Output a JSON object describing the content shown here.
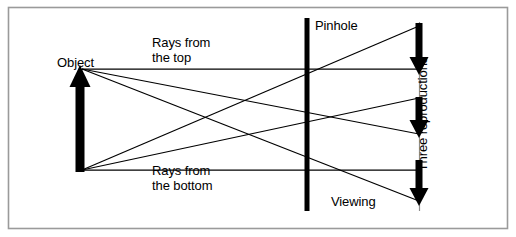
{
  "figure": {
    "type": "optics-ray-diagram",
    "width": 516,
    "height": 237,
    "background_color": "#ffffff",
    "border_color": "#9a9a9a",
    "stroke_color": "#000000"
  },
  "labels": {
    "object": "Object",
    "rays_from_the_top": "Rays from\nthe top",
    "rays_from_the_bottom": "Rays from\nthe bottom",
    "pinhole": "Pinhole",
    "viewing": "Viewing",
    "three_reproductions": "Three reproductions"
  },
  "diagram_data": {
    "object_arrow": {
      "name": "object-arrow",
      "direction": "up",
      "x": 80,
      "tip_y": 66,
      "base_y": 172,
      "shaft_width": 9,
      "head_width": 21,
      "head_height": 22
    },
    "pinhole_barrier": {
      "name": "pinhole-barrier",
      "x": 307,
      "top_y": 18,
      "bottom_y": 211,
      "width": 5
    },
    "viewing_screen": {
      "name": "viewing-screen",
      "x": 419,
      "top_y": 22,
      "bottom_y": 211
    },
    "reproduction_arrows": [
      {
        "name": "reproduction-arrow-1",
        "x": 419,
        "from_y": 23,
        "to_y": 73
      },
      {
        "name": "reproduction-arrow-2",
        "x": 419,
        "from_y": 97,
        "to_y": 136
      },
      {
        "name": "reproduction-arrow-3",
        "x": 419,
        "from_y": 160,
        "to_y": 204
      }
    ],
    "top_rays": [
      {
        "from": [
          82,
          69
        ],
        "to": [
          419,
          69
        ],
        "note": "top ray to middle-screen level"
      },
      {
        "from": [
          82,
          69
        ],
        "to": [
          419,
          134
        ],
        "note": "top ray crossing pinhole downward"
      },
      {
        "from": [
          82,
          69
        ],
        "to": [
          419,
          201
        ],
        "note": "top ray to bottom reproduction"
      }
    ],
    "bottom_rays": [
      {
        "from": [
          82,
          170
        ],
        "to": [
          419,
          170
        ],
        "note": "bottom ray straight through"
      },
      {
        "from": [
          82,
          170
        ],
        "to": [
          419,
          98
        ],
        "note": "bottom ray crossing pinhole upward"
      },
      {
        "from": [
          82,
          170
        ],
        "to": [
          419,
          26
        ],
        "note": "bottom ray to top reproduction"
      }
    ],
    "crossing_point": [
      307,
      119
    ],
    "caption": "Rays from the top and bottom of the object pass through three pinholes and form three inverted reproductions on the viewing screen."
  }
}
